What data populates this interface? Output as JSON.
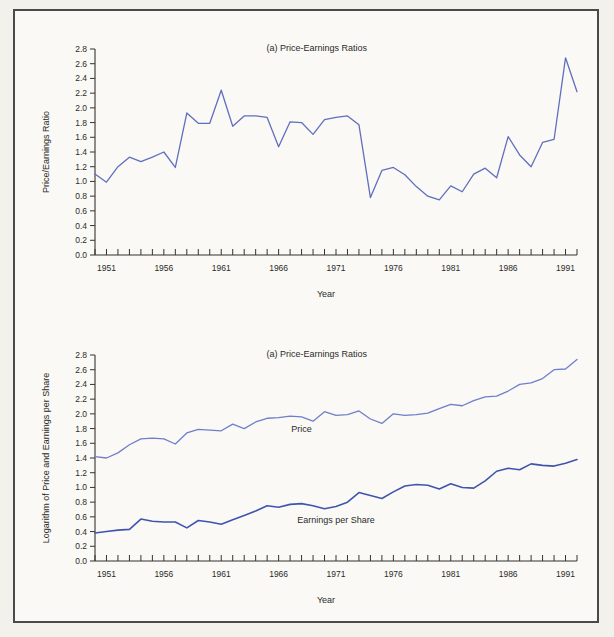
{
  "page": {
    "background_color": "#f2f1ec",
    "frame_color": "#4a4a4a",
    "panel_background": "#faf9f6"
  },
  "chart_data": [
    {
      "id": "panel-a",
      "type": "line",
      "title": "(a) Price-Earnings Ratios",
      "xlabel": "Year",
      "ylabel": "Price/Earnings Ratio",
      "xlim": [
        1950,
        1992
      ],
      "ylim": [
        0.0,
        2.8
      ],
      "yticks": [
        0.0,
        0.2,
        0.4,
        0.6,
        0.8,
        1.0,
        1.2,
        1.4,
        1.6,
        1.8,
        2.0,
        2.2,
        2.4,
        2.6,
        2.8
      ],
      "ytick_labels": [
        "0.0",
        "0.2",
        "0.4",
        "0.6",
        "0.8",
        "1.0",
        "1.2",
        "1.4",
        "1.6",
        "1.8",
        "2.0",
        "2.2",
        "2.4",
        "2.6",
        "2.8"
      ],
      "xticks": [
        1950,
        1951,
        1952,
        1953,
        1954,
        1955,
        1956,
        1957,
        1958,
        1959,
        1960,
        1961,
        1962,
        1963,
        1964,
        1965,
        1966,
        1967,
        1968,
        1969,
        1970,
        1971,
        1972,
        1973,
        1974,
        1975,
        1976,
        1977,
        1978,
        1979,
        1980,
        1981,
        1982,
        1983,
        1984,
        1985,
        1986,
        1987,
        1988,
        1989,
        1990,
        1991,
        1992
      ],
      "xtick_labels": [
        "1951",
        "1956",
        "1961",
        "1966",
        "1971",
        "1976",
        "1981",
        "1986",
        "1991"
      ],
      "xtick_label_years": [
        1951,
        1956,
        1961,
        1966,
        1971,
        1976,
        1981,
        1986,
        1991
      ],
      "grid": false,
      "legend": "none",
      "series": [
        {
          "name": "Price/Earnings Ratio",
          "color": "#5f6fbe",
          "width": 1.3,
          "x": [
            1950,
            1951,
            1952,
            1953,
            1954,
            1955,
            1956,
            1957,
            1958,
            1959,
            1960,
            1961,
            1962,
            1963,
            1964,
            1965,
            1966,
            1967,
            1968,
            1969,
            1970,
            1971,
            1972,
            1973,
            1974,
            1975,
            1976,
            1977,
            1978,
            1979,
            1980,
            1981,
            1982,
            1983,
            1984,
            1985,
            1986,
            1987,
            1988,
            1989,
            1990,
            1991,
            1992
          ],
          "values": [
            1.1,
            0.99,
            1.2,
            1.33,
            1.27,
            1.33,
            1.4,
            1.19,
            1.93,
            1.79,
            1.79,
            2.24,
            1.75,
            1.89,
            1.89,
            1.87,
            1.47,
            1.81,
            1.8,
            1.64,
            1.84,
            1.87,
            1.89,
            1.77,
            0.78,
            1.15,
            1.19,
            1.09,
            0.93,
            0.8,
            0.75,
            0.94,
            0.86,
            1.1,
            1.18,
            1.05,
            1.61,
            1.36,
            1.2,
            1.53,
            1.57,
            2.68,
            2.22
          ]
        }
      ]
    },
    {
      "id": "panel-b",
      "type": "line",
      "title": "(a) Price-Earnings Ratios",
      "xlabel": "Year",
      "ylabel": "Logarithm of Price and Earnings per Share",
      "xlim": [
        1950,
        1992
      ],
      "ylim": [
        0.0,
        2.8
      ],
      "yticks": [
        0.0,
        0.2,
        0.4,
        0.6,
        0.8,
        1.0,
        1.2,
        1.4,
        1.6,
        1.8,
        2.0,
        2.2,
        2.4,
        2.6,
        2.8
      ],
      "ytick_labels": [
        "0.0",
        "0.2",
        "0.4",
        "0.6",
        "0.8",
        "1.0",
        "1.2",
        "1.4",
        "1.6",
        "1.8",
        "2.0",
        "2.2",
        "2.4",
        "2.6",
        "2.8"
      ],
      "xticks": [
        1950,
        1951,
        1952,
        1953,
        1954,
        1955,
        1956,
        1957,
        1958,
        1959,
        1960,
        1961,
        1962,
        1963,
        1964,
        1965,
        1966,
        1967,
        1968,
        1969,
        1970,
        1971,
        1972,
        1973,
        1974,
        1975,
        1976,
        1977,
        1978,
        1979,
        1980,
        1981,
        1982,
        1983,
        1984,
        1985,
        1986,
        1987,
        1988,
        1989,
        1990,
        1991,
        1992
      ],
      "xtick_labels": [
        "1951",
        "1956",
        "1961",
        "1966",
        "1971",
        "1976",
        "1981",
        "1986",
        "1991"
      ],
      "xtick_label_years": [
        1951,
        1956,
        1961,
        1966,
        1971,
        1976,
        1981,
        1986,
        1991
      ],
      "grid": false,
      "legend": "inline",
      "series": [
        {
          "name": "Price",
          "label": "Price",
          "color": "#6f7fc9",
          "width": 1.3,
          "label_year": 1968,
          "label_value": 1.8,
          "x": [
            1950,
            1951,
            1952,
            1953,
            1954,
            1955,
            1956,
            1957,
            1958,
            1959,
            1960,
            1961,
            1962,
            1963,
            1964,
            1965,
            1966,
            1967,
            1968,
            1969,
            1970,
            1971,
            1972,
            1973,
            1974,
            1975,
            1976,
            1977,
            1978,
            1979,
            1980,
            1981,
            1982,
            1983,
            1984,
            1985,
            1986,
            1987,
            1988,
            1989,
            1990,
            1991,
            1992
          ],
          "values": [
            1.42,
            1.4,
            1.47,
            1.58,
            1.66,
            1.67,
            1.66,
            1.59,
            1.74,
            1.79,
            1.78,
            1.77,
            1.86,
            1.8,
            1.89,
            1.94,
            1.95,
            1.97,
            1.96,
            1.9,
            2.03,
            1.98,
            1.99,
            2.04,
            1.93,
            1.87,
            2.0,
            1.98,
            1.99,
            2.01,
            2.07,
            2.13,
            2.11,
            2.18,
            2.23,
            2.24,
            2.31,
            2.4,
            2.42,
            2.48,
            2.6,
            2.61,
            2.74
          ]
        },
        {
          "name": "Earnings per Share",
          "label": "Earnings per Share",
          "color": "#3f55ad",
          "width": 1.6,
          "label_year": 1971,
          "label_value": 0.56,
          "x": [
            1950,
            1951,
            1952,
            1953,
            1954,
            1955,
            1956,
            1957,
            1958,
            1959,
            1960,
            1961,
            1962,
            1963,
            1964,
            1965,
            1966,
            1967,
            1968,
            1969,
            1970,
            1971,
            1972,
            1973,
            1974,
            1975,
            1976,
            1977,
            1978,
            1979,
            1980,
            1981,
            1982,
            1983,
            1984,
            1985,
            1986,
            1987,
            1988,
            1989,
            1990,
            1991,
            1992
          ],
          "values": [
            0.38,
            0.4,
            0.42,
            0.43,
            0.57,
            0.54,
            0.53,
            0.53,
            0.45,
            0.55,
            0.53,
            0.5,
            0.56,
            0.62,
            0.68,
            0.75,
            0.73,
            0.77,
            0.78,
            0.75,
            0.71,
            0.74,
            0.8,
            0.93,
            0.89,
            0.85,
            0.94,
            1.02,
            1.04,
            1.03,
            0.98,
            1.05,
            1.0,
            0.99,
            1.09,
            1.22,
            1.26,
            1.24,
            1.32,
            1.3,
            1.29,
            1.33,
            1.38
          ]
        }
      ]
    }
  ]
}
